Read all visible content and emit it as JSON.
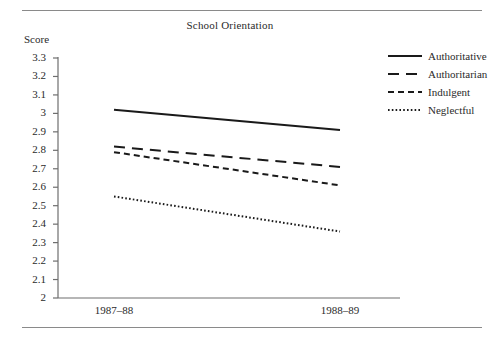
{
  "figure": {
    "top_rule": "",
    "bottom_rule": ""
  },
  "chart_data": {
    "type": "line",
    "title": "School Orientation",
    "xlabel": "",
    "ylabel": "Score",
    "categories": [
      "1987–88",
      "1988–89"
    ],
    "x": [
      0,
      1
    ],
    "ylim": [
      2,
      3.3
    ],
    "yticks": [
      "3.3",
      "3.2",
      "3.1",
      "3",
      "2.9",
      "2.8",
      "2.7",
      "2.6",
      "2.5",
      "2.4",
      "2.3",
      "2.2",
      "2.1",
      "2"
    ],
    "ytick_values": [
      3.3,
      3.2,
      3.1,
      3.0,
      2.9,
      2.8,
      2.7,
      2.6,
      2.5,
      2.4,
      2.3,
      2.2,
      2.1,
      2.0
    ],
    "grid": false,
    "legend_position": "right",
    "series": [
      {
        "name": "Authoritative",
        "values": [
          3.02,
          2.91
        ],
        "style": "solid",
        "color": "#1a1a1a"
      },
      {
        "name": "Authoritarian",
        "values": [
          2.82,
          2.71
        ],
        "style": "long-dash",
        "color": "#1a1a1a"
      },
      {
        "name": "Indulgent",
        "values": [
          2.79,
          2.61
        ],
        "style": "short-dash",
        "color": "#1a1a1a"
      },
      {
        "name": "Neglectful",
        "values": [
          2.55,
          2.36
        ],
        "style": "dotted",
        "color": "#1a1a1a"
      }
    ]
  },
  "axes": {
    "axis_color": "#6e6e6e",
    "tick_color": "#6e6e6e"
  }
}
